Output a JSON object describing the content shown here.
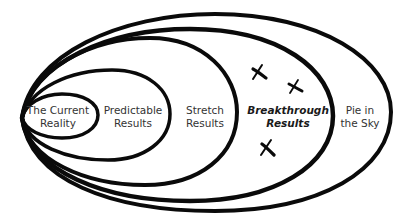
{
  "diagram": {
    "type": "nested-ellipses",
    "stroke_color": "#0a0a0a",
    "background": "#ffffff",
    "zones": [
      {
        "id": "current-reality",
        "lines": [
          "The Current",
          "Reality"
        ],
        "emphasis": false
      },
      {
        "id": "predictable-results",
        "lines": [
          "Predictable",
          "Results"
        ],
        "emphasis": false
      },
      {
        "id": "stretch-results",
        "lines": [
          "Stretch",
          "Results"
        ],
        "emphasis": false
      },
      {
        "id": "breakthrough-results",
        "lines": [
          "Breakthrough",
          "Results"
        ],
        "emphasis": true
      },
      {
        "id": "pie-in-the-sky",
        "lines": [
          "Pie in",
          "the Sky"
        ],
        "emphasis": false
      }
    ],
    "markers": [
      {
        "symbol": "X",
        "zone": "breakthrough-results"
      },
      {
        "symbol": "X",
        "zone": "breakthrough-results"
      },
      {
        "symbol": "X",
        "zone": "breakthrough-results"
      }
    ]
  }
}
